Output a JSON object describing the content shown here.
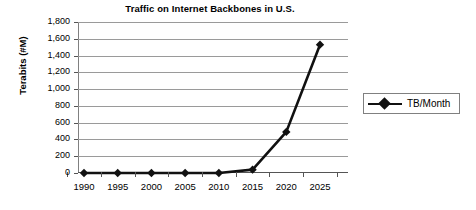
{
  "chart_data": {
    "type": "line",
    "title": "Traffic on Internet Backbones in U.S.",
    "xlabel": "",
    "ylabel": "Terabits (#M)",
    "x": [
      1990,
      1995,
      2000,
      2005,
      2010,
      2015,
      2020,
      2025
    ],
    "categories": [
      "1990",
      "1995",
      "2000",
      "2005",
      "2010",
      "2015",
      "2020",
      "2025"
    ],
    "series": [
      {
        "name": "TB/Month",
        "values": [
          0,
          0,
          0,
          0,
          0,
          40,
          490,
          1530
        ],
        "color": "#111111",
        "marker": "diamond"
      }
    ],
    "ylim": [
      0,
      1800
    ],
    "yticks": [
      0,
      200,
      400,
      600,
      800,
      1000,
      1200,
      1400,
      1600,
      1800
    ],
    "ytick_labels": [
      "0",
      "200",
      "400",
      "600",
      "800",
      "1,000",
      "1,200",
      "1,400",
      "1,600",
      "1,800"
    ],
    "xlim": [
      1990,
      2025
    ],
    "grid": "horizontal",
    "legend_position": "right"
  },
  "legend": {
    "entries": [
      {
        "label": "TB/Month"
      }
    ]
  }
}
